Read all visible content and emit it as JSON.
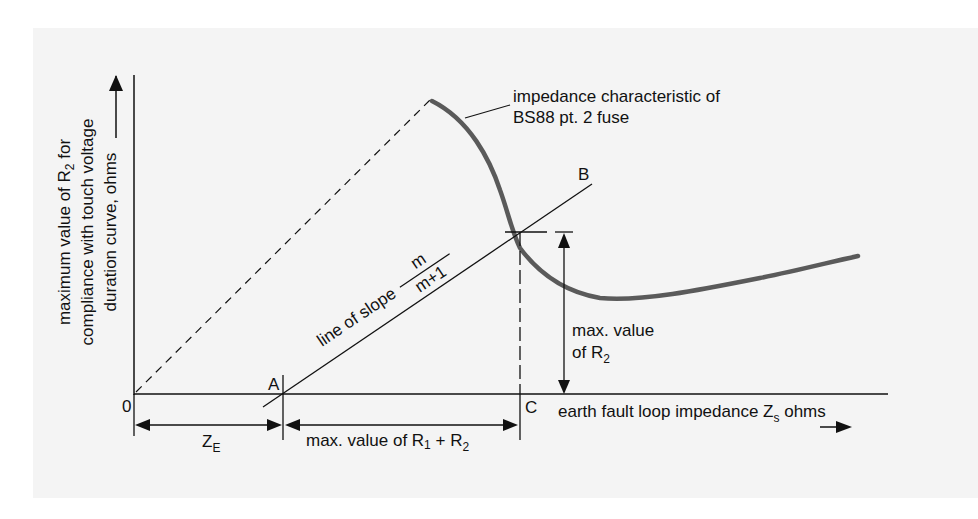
{
  "diagram": {
    "y_axis_label": {
      "line1": "maximum value of R",
      "line1_sub": "2",
      "line1_end": " for",
      "line2": "compliance with touch voltage",
      "line3": "duration curve, ohms"
    },
    "x_axis_label": {
      "text": "earth fault loop impedance Z",
      "sub": "s",
      "end": " ohms"
    },
    "points": {
      "origin": "0",
      "A": "A",
      "B": "B",
      "C": "C"
    },
    "curve_label": {
      "line1": "impedance characteristic of",
      "line2": "BS88 pt. 2 fuse"
    },
    "slope_label": {
      "text": "line of slope",
      "numerator": "m",
      "denominator": "m+1"
    },
    "r2_label": {
      "line1": "max. value",
      "line2": "of R",
      "line2_sub": "2"
    },
    "ze_label": {
      "text": "Z",
      "sub": "E"
    },
    "r1r2_label": {
      "text": "max. value of R",
      "sub1": "1",
      "mid": " + R",
      "sub2": "2"
    },
    "colors": {
      "background": "#f4f4f4",
      "line": "#111111",
      "curve": "#5a5a5a"
    }
  }
}
